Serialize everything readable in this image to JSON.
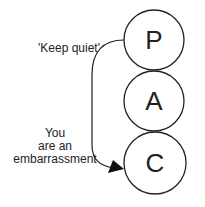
{
  "diagram": {
    "nodes": [
      {
        "id": "P",
        "label": "P",
        "cx": 154,
        "cy": 40,
        "r": 30
      },
      {
        "id": "A",
        "label": "A",
        "cx": 154,
        "cy": 101,
        "r": 30
      },
      {
        "id": "C",
        "label": "C",
        "cx": 155,
        "cy": 163,
        "r": 31
      }
    ],
    "edges": [
      {
        "from": "P",
        "to": "C",
        "label_from": "'Keep quiet'",
        "label_to": [
          "You",
          "are an",
          "embarrassment"
        ]
      }
    ],
    "colors": {
      "stroke": "#222222",
      "background": "#ffffff"
    }
  }
}
